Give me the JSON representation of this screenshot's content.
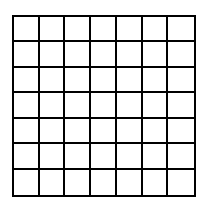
{
  "grid": {
    "rows": 7,
    "cols": 7,
    "line_color": "#000000",
    "fill_color": "#ffffff"
  }
}
